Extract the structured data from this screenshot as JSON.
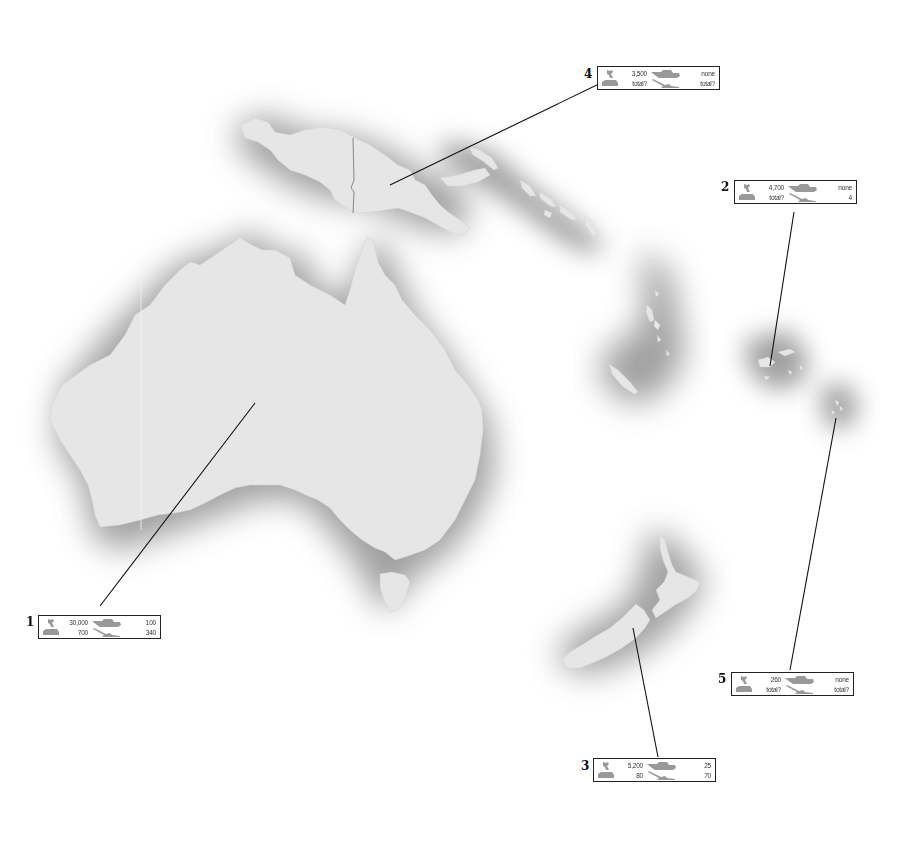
{
  "map": {
    "region": "Oceania",
    "land_color": "#e6e6e6",
    "halo_color": "#8f8f8f",
    "leader_line_color": "#111111"
  },
  "legend_icons": {
    "troops": "soldier-icon",
    "tanks": "tank-icon",
    "apcs": "armored-vehicle-icon",
    "artillery": "artillery-gun-icon"
  },
  "boxes": [
    {
      "number": "1",
      "troops": "30,000",
      "tanks": "100",
      "apcs": "700",
      "artillery": "340"
    },
    {
      "number": "2",
      "troops": "4,700",
      "tanks": "none",
      "apcs": "total?",
      "artillery": "4"
    },
    {
      "number": "3",
      "troops": "5,200",
      "tanks": "25",
      "apcs": "80",
      "artillery": "70"
    },
    {
      "number": "4",
      "troops": "3,500",
      "tanks": "none",
      "apcs": "total?",
      "artillery": "total?"
    },
    {
      "number": "5",
      "troops": "260",
      "tanks": "none",
      "apcs": "total?",
      "artillery": "total?"
    }
  ]
}
